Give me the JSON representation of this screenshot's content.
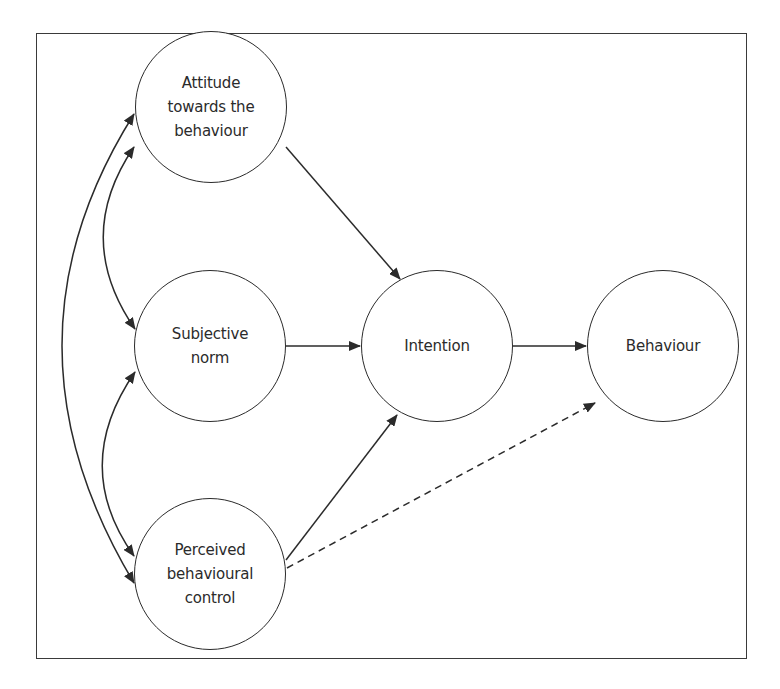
{
  "diagram": {
    "title": "",
    "nodes": {
      "attitude": {
        "label": "Attitude\ntowards the\nbehaviour"
      },
      "subjective_norm": {
        "label": "Subjective\nnorm"
      },
      "pbc": {
        "label": "Perceived\nbehavioural\ncontrol"
      },
      "intention": {
        "label": "Intention"
      },
      "behaviour": {
        "label": "Behaviour"
      }
    },
    "edges": [
      {
        "from": "Attitude towards the behaviour",
        "to": "Intention",
        "style": "solid"
      },
      {
        "from": "Subjective norm",
        "to": "Intention",
        "style": "solid"
      },
      {
        "from": "Perceived behavioural control",
        "to": "Intention",
        "style": "solid"
      },
      {
        "from": "Intention",
        "to": "Behaviour",
        "style": "solid"
      },
      {
        "from": "Perceived behavioural control",
        "to": "Behaviour",
        "style": "dashed"
      },
      {
        "from": "Attitude towards the behaviour",
        "to": "Subjective norm",
        "style": "curved-bidirectional"
      },
      {
        "from": "Subjective norm",
        "to": "Perceived behavioural control",
        "style": "curved-bidirectional"
      },
      {
        "from": "Attitude towards the behaviour",
        "to": "Perceived behavioural control",
        "style": "curved-bidirectional"
      }
    ],
    "colors": {
      "stroke": "#2b2b2b",
      "background": "#ffffff"
    }
  }
}
